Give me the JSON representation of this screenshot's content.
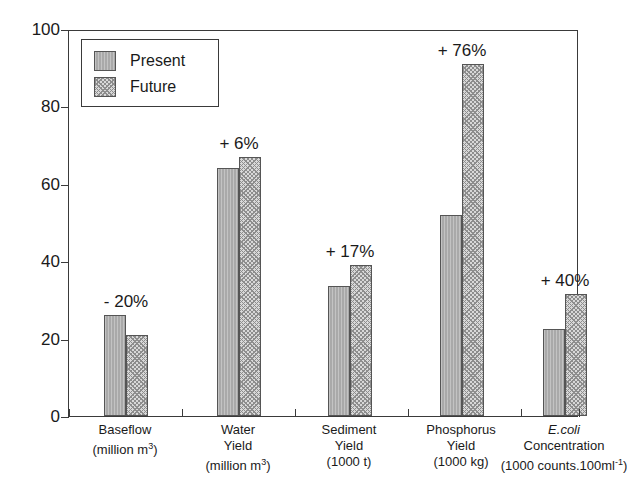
{
  "chart_data": {
    "type": "bar",
    "title": "",
    "subtitle": "",
    "xlabel": "",
    "ylabel": "",
    "ylim": [
      0,
      100
    ],
    "yticks": [
      0,
      20,
      40,
      60,
      80,
      100
    ],
    "grid": false,
    "legend_position": "top-left",
    "categories": [
      "Baseflow (million m3)",
      "Water Yield (million m3)",
      "Sediment Yield (1000 t)",
      "Phosphorus Yield (1000 kg)",
      "E.coli Concentration (1000 counts.100ml-1)"
    ],
    "series": [
      {
        "name": "Present",
        "values": [
          26,
          64,
          33.5,
          52,
          22.5
        ]
      },
      {
        "name": "Future",
        "values": [
          21,
          67,
          39,
          91,
          31.5
        ]
      }
    ],
    "annotations": [
      "- 20%",
      "+ 6%",
      "+ 17%",
      "+ 76%",
      "+ 40%"
    ]
  },
  "legend": {
    "items": [
      {
        "label": "Present",
        "pattern": "solid-gray",
        "color": "#a9a9a9"
      },
      {
        "label": "Future",
        "pattern": "cross-hatch",
        "color": "#d8d8d8"
      }
    ]
  },
  "axis": {
    "y_tick_labels": [
      "100",
      "80",
      "60",
      "40",
      "20",
      "0"
    ]
  },
  "x_labels": [
    {
      "line1": "Baseflow",
      "line2": "(million m",
      "sup2": "3",
      "line2_end": ")",
      "line3": "",
      "italic1": false
    },
    {
      "line1": "Water",
      "line2": "Yield",
      "line3": "(million m",
      "sup3": "3",
      "line3_end": ")",
      "italic1": false
    },
    {
      "line1": "Sediment",
      "line2": "Yield",
      "line3": "(1000 t)",
      "italic1": false
    },
    {
      "line1": "Phosphorus",
      "line2": "Yield",
      "line3": "(1000 kg)",
      "italic1": false
    },
    {
      "line1": "E.coli",
      "line2": "Concentration",
      "line3": "(1000 counts.100ml",
      "sup3": "-1",
      "line3_end": ")",
      "italic1": true
    }
  ],
  "colors": {
    "present_fill": "#a9a9a9",
    "future_fill": "#d8d8d8",
    "hatch": "#8d8d8d",
    "axis": "#3a3a3a",
    "text": "#1a1a1a",
    "background": "#ffffff"
  }
}
